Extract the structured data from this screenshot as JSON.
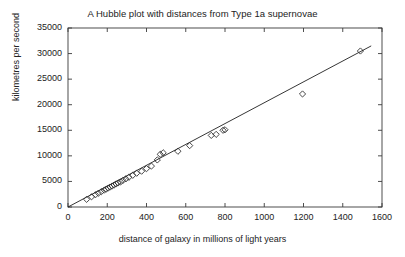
{
  "chart_data": {
    "type": "scatter",
    "title": "A Hubble plot with distances from Type 1a supernovae",
    "xlabel": "distance of galaxy in millions of light years",
    "ylabel": "kilometres per second",
    "xlim": [
      0,
      1600
    ],
    "ylim": [
      0,
      35000
    ],
    "xticks": [
      0,
      200,
      400,
      600,
      800,
      1000,
      1200,
      1400,
      1600
    ],
    "yticks": [
      0,
      5000,
      10000,
      15000,
      20000,
      25000,
      30000,
      35000
    ],
    "grid": false,
    "legend": null,
    "marker": "diamond",
    "marker_color": "#333333",
    "marker_filled": false,
    "series": [
      {
        "name": "Type 1a supernovae",
        "x": [
          95,
          120,
          140,
          155,
          170,
          185,
          195,
          205,
          215,
          225,
          235,
          245,
          255,
          268,
          280,
          295,
          310,
          330,
          350,
          375,
          400,
          425,
          455,
          470,
          485,
          560,
          620,
          730,
          755,
          790,
          800,
          1195,
          1490
        ],
        "y": [
          1500,
          2000,
          2400,
          2700,
          3000,
          3300,
          3500,
          3700,
          3900,
          4100,
          4300,
          4500,
          4700,
          4900,
          5200,
          5500,
          5800,
          6200,
          6600,
          7000,
          7500,
          8000,
          9200,
          10300,
          10600,
          10900,
          12000,
          14000,
          14200,
          15000,
          15100,
          22100,
          30500
        ]
      }
    ],
    "fit_line": {
      "name": "linear fit through origin",
      "x0": 0,
      "y0": 0,
      "x1": 1545,
      "y1": 31500
    }
  }
}
